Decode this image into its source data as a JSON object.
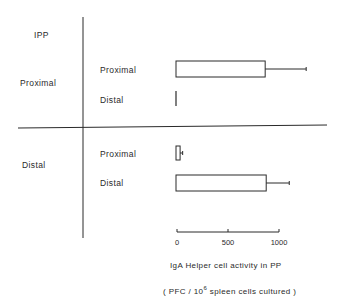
{
  "chart_data": {
    "type": "bar",
    "orientation": "horizontal",
    "row_group_title": "IPP",
    "groups": [
      {
        "label": "Proximal",
        "bars": [
          {
            "label": "Proximal",
            "value": 870,
            "error": 400
          },
          {
            "label": "Distal",
            "value": 0,
            "error": 0
          }
        ]
      },
      {
        "label": "Distal",
        "bars": [
          {
            "label": "Proximal",
            "value": 40,
            "error": 25
          },
          {
            "label": "Distal",
            "value": 880,
            "error": 225
          }
        ]
      }
    ],
    "xaxis": {
      "ticks": [
        0,
        500,
        1000
      ],
      "tick_labels": [
        "0",
        "500",
        "1000"
      ],
      "range": [
        0,
        1000
      ],
      "label_line1": "IgA Helper  cell activity  in PP",
      "label_line2_prefix": "( PFC / 10",
      "label_line2_sup": "6",
      "label_line2_suffix": " spleen cells  cultured )"
    },
    "grid": false,
    "legend": "none",
    "bar_fill": "#ffffff",
    "line_color": "#2a2a2a"
  }
}
